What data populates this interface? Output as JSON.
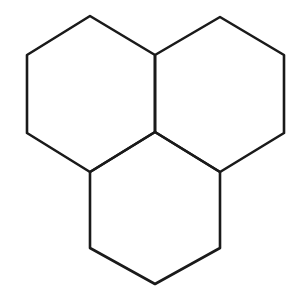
{
  "figure": {
    "shape_type": "line-diagram",
    "width": 305,
    "height": 300,
    "background_color": "#ffffff",
    "stroke_color": "#1a1a1a",
    "fill_color": "#ffffff",
    "stroke_width": 2.6,
    "ring_count": 3,
    "orientation": "pointy-top",
    "arrangement": "two hexagons on top row, one hexagon centered below",
    "shared_vertices": 2,
    "labels": [],
    "annotations": []
  },
  "geometry": {
    "vertices": {
      "top_left_apex": [
        90,
        16
      ],
      "top_right_apex": [
        220,
        17
      ],
      "upper_left": [
        27,
        55
      ],
      "center_top_junction": [
        155,
        55
      ],
      "upper_right": [
        284,
        55
      ],
      "lower_left": [
        27,
        133
      ],
      "center_bottom_junction": [
        155,
        132
      ],
      "lower_right": [
        284,
        133
      ],
      "bottom_left_junction": [
        90,
        172
      ],
      "bottom_right_junction": [
        220,
        172
      ],
      "bottom_left_vertex": [
        90,
        248
      ],
      "bottom_right_vertex": [
        220,
        248
      ],
      "bottom_apex": [
        155,
        284
      ]
    },
    "rings": [
      {
        "name": "left-hexagon",
        "points": "90,16 155,55 155,132 90,172 27,133 27,55"
      },
      {
        "name": "right-hexagon",
        "points": "220,17 284,55 284,133 220,172 155,132 155,55"
      },
      {
        "name": "bottom-hexagon",
        "points": "155,132 220,172 220,248 155,284 90,248 90,172"
      }
    ]
  }
}
